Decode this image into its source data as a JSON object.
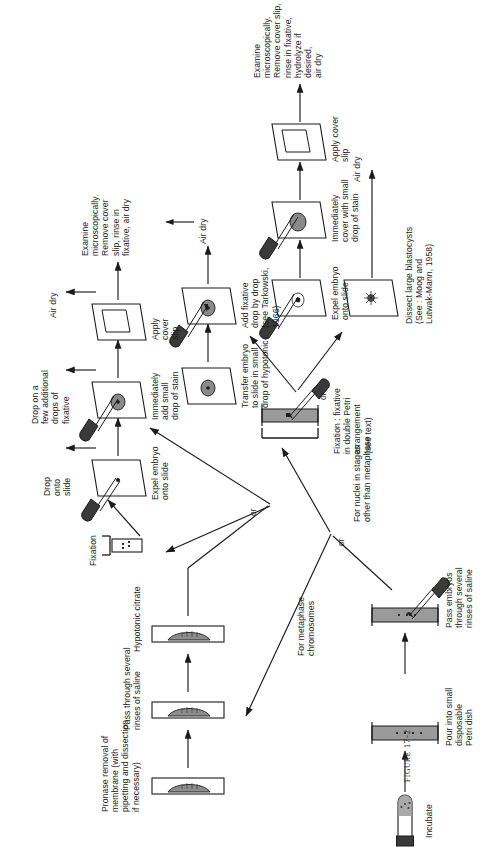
{
  "figure": {
    "caption_label": "FIGURE",
    "caption_number": "17-2",
    "caption_full": "FIGURE 17-2"
  },
  "diagram": {
    "type": "laboratory-protocol-flowchart",
    "orientation": "rotated-90-counterclockwise",
    "branch_connector_label": "or"
  },
  "nodes": {
    "incubate": "Incubate",
    "pour_petri": "Pour into small\ndisposable\nPetri dish",
    "pass_embryos": "Pass embryos\nthrough several\nrinses of saline",
    "branch_metaphase": "For metaphase\nchromosomes",
    "branch_nuclei": "For nuclei in stages\nother than metaphase",
    "pronase": "Pronase removal of\nmembrane (with\npipetting and dissection\nif necessary)",
    "pass_saline": "Pass through several\nrinses of saline",
    "hypotonic_citrate": "Hypotonic citrate",
    "fixation": "Fixation",
    "fixation_double_petri": "Fixation : fixative\nin double Petri\narrangement\n(see text)",
    "expel_embryo_slide_a": "Expel embryo\nonto slide",
    "drop_onto_slide": "Drop\nonto\nslide",
    "drop_extra_fixative": "Drop on a\nfew additional\ndrops of\nfixative",
    "air_dry_top": "Air dry",
    "add_stain_a": "Immediately\nadd small\ndrop of stain",
    "apply_cover_slip_a": "Apply\ncover\nslip",
    "examine_a": "Examine\nmicroscopically.\nRemove cover\nslip, rinse in\nfixative, air dry",
    "transfer_hypotonic": "Transfer embryo\nto slide in small\ndrop of hypotonic",
    "add_fixative_dropwise": "Add fixative\ndrop by drop\n(see Tarkowski,\n1966)",
    "air_dry_mid": "Air dry",
    "expel_embryo_slide_b": "Expel embryo\nonto slide",
    "add_stain_b": "Immediately\ncover with small\ndrop of stain",
    "apply_cover_slip_b": "Apply cover\nslip",
    "examine_b": "Examine\nmicroscopically.\nRemove cover slip,\nrinse in fixative,\nhydrolyze if desired,\nair dry",
    "dissect_blastocysts": "Dissect large blastocysts\n(See : Moog and\nLutwak-Mann, 1958)",
    "air_dry_bottom": "Air dry"
  },
  "colors": {
    "ink": "#1b1b1b",
    "glass_fill": "#ffffff",
    "liquid_fill": "#8d8d8d",
    "dish_fill": "#9a9a9a",
    "tube_cap": "#3a3a3a",
    "embryo_fill": "#8a8a8a",
    "background": "#ffffff"
  }
}
